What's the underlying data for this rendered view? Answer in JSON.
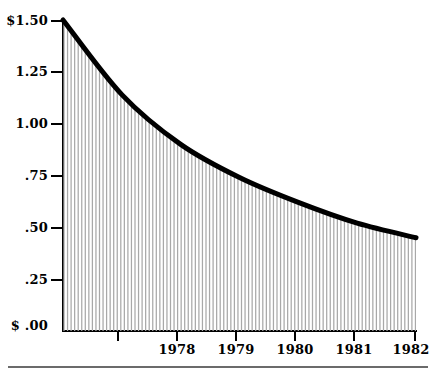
{
  "chart_data": {
    "type": "area",
    "title": "",
    "subtitle": "",
    "xlabel": "",
    "ylabel": "",
    "x": [
      1977.0,
      1978.0,
      1979.0,
      1980.0,
      1981.0,
      1982.0,
      1983.0
    ],
    "values": [
      1.5,
      1.14,
      0.9,
      0.74,
      0.62,
      0.52,
      0.45
    ],
    "series": [
      {
        "name": "Value of the dollar",
        "values": [
          1.5,
          1.14,
          0.9,
          0.74,
          0.62,
          0.52,
          0.45
        ]
      }
    ],
    "categories": [
      "1977",
      "1978",
      "1979",
      "1980",
      "1981",
      "1982",
      "1983"
    ],
    "ylim": [
      0.0,
      1.5
    ],
    "xlim": [
      1977.0,
      1983.0
    ],
    "ytick_values": [
      1.5,
      1.25,
      1.0,
      0.75,
      0.5,
      0.25,
      0.0
    ],
    "ytick_labels": [
      "$1.50",
      "1.25",
      "1.00",
      ".75",
      ".50",
      ".25",
      "$ .00"
    ],
    "xtick_values": [
      1978,
      1979,
      1980,
      1981,
      1982,
      1983
    ],
    "xtick_labels": [
      "1978",
      "1979",
      "1980",
      "1981",
      "1982",
      "1983"
    ],
    "grid": false,
    "legend": "none",
    "fill_style": "vertical-hatch",
    "curve_color": "#000000",
    "fill_line_color": "#a8a8a8",
    "background_color": "#ffffff"
  },
  "axis": {
    "y": {
      "ticks": [
        {
          "label": "$1.50",
          "value": 1.5
        },
        {
          "label": "1.25",
          "value": 1.25
        },
        {
          "label": "1.00",
          "value": 1.0
        },
        {
          "label": ".75",
          "value": 0.75
        },
        {
          "label": ".50",
          "value": 0.5
        },
        {
          "label": ".25",
          "value": 0.25
        },
        {
          "label": "$ .00",
          "value": 0.0
        }
      ]
    },
    "x": {
      "ticks": [
        {
          "label": "1978",
          "value": 1978
        },
        {
          "label": "1979",
          "value": 1979
        },
        {
          "label": "1980",
          "value": 1980
        },
        {
          "label": "1981",
          "value": 1981
        },
        {
          "label": "1982",
          "value": 1982
        },
        {
          "label": "1983",
          "value": 1983
        }
      ]
    }
  }
}
